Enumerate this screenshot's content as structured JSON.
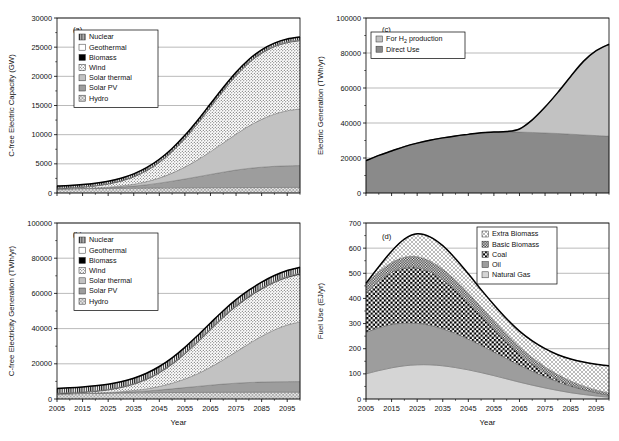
{
  "figure": {
    "title": "",
    "panels": [
      "a",
      "b",
      "c",
      "d"
    ],
    "xlabel": "Year",
    "x_ticks": [
      "2005",
      "2015",
      "2025",
      "2035",
      "2045",
      "2055",
      "2065",
      "2075",
      "2085",
      "2095"
    ],
    "x_range": [
      2005,
      2100
    ]
  },
  "chart_data": [
    {
      "id": "a",
      "tag": "(a)",
      "type": "area",
      "title": "",
      "xlabel": "Year",
      "ylabel": "C-free Electric Capacity (GW)",
      "ylim": [
        0,
        30000
      ],
      "y_ticks": [
        0,
        5000,
        10000,
        15000,
        20000,
        25000,
        30000
      ],
      "xlim": [
        2005,
        2100
      ],
      "x_ticks": [
        "2005",
        "2015",
        "2025",
        "2035",
        "2045",
        "2055",
        "2065",
        "2075",
        "2085",
        "2095"
      ],
      "grid": true,
      "legend_position": "upper-left",
      "stacked": true,
      "x": [
        2005,
        2010,
        2015,
        2020,
        2025,
        2030,
        2035,
        2040,
        2045,
        2050,
        2055,
        2060,
        2065,
        2070,
        2075,
        2080,
        2085,
        2090,
        2095,
        2100
      ],
      "series": [
        {
          "name": "Hydro",
          "pattern": "hydro-dots",
          "values": [
            700,
            720,
            740,
            760,
            780,
            800,
            820,
            840,
            860,
            880,
            895,
            905,
            915,
            925,
            935,
            940,
            945,
            950,
            955,
            960
          ]
        },
        {
          "name": "Solar PV",
          "pattern": "solid-mid-gray",
          "values": [
            5,
            15,
            35,
            70,
            130,
            220,
            360,
            560,
            830,
            1150,
            1500,
            1880,
            2270,
            2650,
            3000,
            3280,
            3480,
            3620,
            3700,
            3740
          ]
        },
        {
          "name": "Solar thermal",
          "pattern": "solid-light-gray",
          "values": [
            2,
            8,
            20,
            45,
            95,
            180,
            320,
            540,
            880,
            1380,
            2050,
            2900,
            3900,
            5000,
            6150,
            7250,
            8200,
            8950,
            9450,
            9700
          ]
        },
        {
          "name": "Wind",
          "pattern": "fine-dots",
          "values": [
            60,
            110,
            190,
            320,
            520,
            820,
            1250,
            1850,
            2650,
            3650,
            4850,
            6200,
            7600,
            8900,
            10000,
            10800,
            11300,
            11550,
            11650,
            11700
          ]
        },
        {
          "name": "Biomass",
          "pattern": "solid-black",
          "values": [
            40,
            45,
            50,
            55,
            60,
            65,
            70,
            75,
            80,
            85,
            88,
            90,
            92,
            94,
            96,
            97,
            98,
            99,
            100,
            100
          ]
        },
        {
          "name": "Geothermal",
          "pattern": "white",
          "values": [
            12,
            14,
            16,
            19,
            22,
            25,
            28,
            32,
            36,
            40,
            43,
            46,
            48,
            50,
            52,
            54,
            55,
            56,
            57,
            58
          ]
        },
        {
          "name": "Nuclear",
          "pattern": "vertical-stripes",
          "values": [
            370,
            380,
            390,
            400,
            410,
            420,
            430,
            440,
            450,
            455,
            460,
            465,
            468,
            470,
            472,
            474,
            476,
            478,
            480,
            480
          ]
        }
      ],
      "legend": [
        {
          "label": "Nuclear",
          "pattern": "vertical-stripes"
        },
        {
          "label": "Geothermal",
          "pattern": "white"
        },
        {
          "label": "Biomass",
          "pattern": "solid-black"
        },
        {
          "label": "Wind",
          "pattern": "fine-dots"
        },
        {
          "label": "Solar thermal",
          "pattern": "solid-light-gray"
        },
        {
          "label": "Solar PV",
          "pattern": "solid-mid-gray"
        },
        {
          "label": "Hydro",
          "pattern": "hydro-dots"
        }
      ]
    },
    {
      "id": "b",
      "tag": "(b)",
      "type": "area",
      "title": "",
      "xlabel": "Year",
      "ylabel": "C-free Electricity Generation (TWh/yr)",
      "ylim": [
        0,
        100000
      ],
      "y_ticks": [
        0,
        20000,
        40000,
        60000,
        80000,
        100000
      ],
      "xlim": [
        2005,
        2100
      ],
      "x_ticks": [
        "2005",
        "2015",
        "2025",
        "2035",
        "2045",
        "2055",
        "2065",
        "2075",
        "2085",
        "2095"
      ],
      "grid": true,
      "legend_position": "upper-left",
      "stacked": true,
      "x": [
        2005,
        2010,
        2015,
        2020,
        2025,
        2030,
        2035,
        2040,
        2045,
        2050,
        2055,
        2060,
        2065,
        2070,
        2075,
        2080,
        2085,
        2090,
        2095,
        2100
      ],
      "series": [
        {
          "name": "Hydro",
          "pattern": "hydro-dots",
          "values": [
            2900,
            3000,
            3100,
            3200,
            3300,
            3400,
            3480,
            3550,
            3620,
            3680,
            3720,
            3760,
            3790,
            3820,
            3840,
            3860,
            3875,
            3890,
            3900,
            3910
          ]
        },
        {
          "name": "Solar PV",
          "pattern": "solid-mid-gray",
          "values": [
            8,
            25,
            60,
            120,
            230,
            400,
            650,
            1000,
            1500,
            2100,
            2750,
            3400,
            4050,
            4650,
            5150,
            5500,
            5750,
            5880,
            5950,
            5980
          ]
        },
        {
          "name": "Solar thermal",
          "pattern": "solid-light-gray",
          "values": [
            4,
            15,
            40,
            95,
            200,
            390,
            700,
            1200,
            2000,
            3200,
            4900,
            7200,
            10200,
            13800,
            17800,
            22000,
            26000,
            29500,
            32200,
            33900
          ]
        },
        {
          "name": "Wind",
          "pattern": "fine-dots",
          "values": [
            140,
            260,
            470,
            820,
            1380,
            2250,
            3500,
            5300,
            7700,
            10700,
            14200,
            17900,
            21300,
            24000,
            25700,
            26500,
            26800,
            26900,
            26950,
            27000
          ]
        },
        {
          "name": "Biomass",
          "pattern": "solid-black",
          "values": [
            250,
            270,
            290,
            310,
            330,
            350,
            370,
            390,
            405,
            420,
            432,
            442,
            450,
            458,
            464,
            470,
            474,
            478,
            480,
            482
          ]
        },
        {
          "name": "Geothermal",
          "pattern": "white",
          "values": [
            60,
            70,
            82,
            96,
            112,
            130,
            148,
            168,
            188,
            208,
            224,
            238,
            250,
            260,
            268,
            275,
            280,
            284,
            288,
            290
          ]
        },
        {
          "name": "Nuclear",
          "pattern": "vertical-stripes",
          "values": [
            2650,
            2700,
            2760,
            2820,
            2880,
            2930,
            2980,
            3020,
            3060,
            3090,
            3120,
            3140,
            3160,
            3180,
            3195,
            3210,
            3220,
            3230,
            3240,
            3250
          ]
        }
      ],
      "legend": [
        {
          "label": "Nuclear",
          "pattern": "vertical-stripes"
        },
        {
          "label": "Geothermal",
          "pattern": "white"
        },
        {
          "label": "Biomass",
          "pattern": "solid-black"
        },
        {
          "label": "Wind",
          "pattern": "fine-dots"
        },
        {
          "label": "Solar thermal",
          "pattern": "solid-light-gray"
        },
        {
          "label": "Solar PV",
          "pattern": "solid-mid-gray"
        },
        {
          "label": "Hydro",
          "pattern": "hydro-dots"
        }
      ]
    },
    {
      "id": "c",
      "tag": "(c)",
      "type": "area",
      "title": "",
      "xlabel": "Year",
      "ylabel": "Electric Generation (TWh/yr)",
      "ylim": [
        0,
        100000
      ],
      "y_ticks": [
        0,
        20000,
        40000,
        60000,
        80000,
        100000
      ],
      "xlim": [
        2005,
        2100
      ],
      "x_ticks": [
        "2005",
        "2015",
        "2025",
        "2035",
        "2045",
        "2055",
        "2065",
        "2075",
        "2085",
        "2095"
      ],
      "grid": true,
      "legend_position": "upper-left",
      "stacked": true,
      "x": [
        2005,
        2010,
        2015,
        2020,
        2025,
        2030,
        2035,
        2040,
        2045,
        2050,
        2055,
        2060,
        2065,
        2070,
        2075,
        2080,
        2085,
        2090,
        2095,
        2100
      ],
      "series": [
        {
          "name": "Direct Use",
          "pattern": "solid-dark-gray",
          "values": [
            18500,
            21500,
            24000,
            26500,
            28500,
            30200,
            31500,
            32600,
            33500,
            34400,
            34800,
            34900,
            34800,
            34600,
            34300,
            34000,
            33600,
            33200,
            32800,
            32500
          ]
        },
        {
          "name": "For H2 production",
          "pattern": "solid-light-gray",
          "values": [
            0,
            0,
            0,
            0,
            0,
            0,
            0,
            0,
            0,
            0,
            0,
            200,
            1800,
            7200,
            14800,
            23500,
            33000,
            42000,
            48500,
            52500
          ]
        }
      ],
      "legend": [
        {
          "label": "For H",
          "label_sub": "2",
          "label_tail": " production",
          "pattern": "solid-light-gray"
        },
        {
          "label": "Direct Use",
          "pattern": "solid-dark-gray"
        }
      ]
    },
    {
      "id": "d",
      "tag": "(d)",
      "type": "area",
      "title": "",
      "xlabel": "Year",
      "ylabel": "Fuel Use (EJ/yr)",
      "ylim": [
        0,
        700
      ],
      "y_ticks": [
        0,
        100,
        200,
        300,
        400,
        500,
        600,
        700
      ],
      "xlim": [
        2005,
        2100
      ],
      "x_ticks": [
        "2005",
        "2015",
        "2025",
        "2035",
        "2045",
        "2055",
        "2065",
        "2075",
        "2085",
        "2095"
      ],
      "grid": true,
      "legend_position": "upper-right",
      "stacked": true,
      "x": [
        2005,
        2010,
        2015,
        2020,
        2025,
        2030,
        2035,
        2040,
        2045,
        2050,
        2055,
        2060,
        2065,
        2070,
        2075,
        2080,
        2085,
        2090,
        2095,
        2100
      ],
      "series": [
        {
          "name": "Natural Gas",
          "pattern": "solid-pale-gray",
          "values": [
            100,
            113,
            124,
            132,
            136,
            136,
            132,
            125,
            116,
            105,
            93,
            80,
            67,
            55,
            44,
            34,
            25,
            18,
            12,
            7
          ]
        },
        {
          "name": "Oil",
          "pattern": "solid-mid-gray",
          "values": [
            165,
            170,
            172,
            170,
            165,
            157,
            147,
            135,
            122,
            108,
            94,
            80,
            67,
            55,
            44,
            34,
            26,
            19,
            13,
            8
          ]
        },
        {
          "name": "Coal",
          "pattern": "check-grid",
          "values": [
            155,
            185,
            207,
            220,
            222,
            213,
            196,
            172,
            145,
            117,
            90,
            66,
            45,
            29,
            17,
            9,
            4,
            1,
            0,
            0
          ]
        },
        {
          "name": "Basic Biomass",
          "pattern": "dark-check",
          "values": [
            35,
            38,
            40,
            42,
            43,
            43,
            42,
            41,
            39,
            37,
            35,
            32,
            29,
            26,
            23,
            20,
            17,
            14,
            11,
            9
          ]
        },
        {
          "name": "Extra Biomass",
          "pattern": "coarse-dots",
          "values": [
            5,
            20,
            45,
            72,
            91,
            96,
            93,
            85,
            76,
            68,
            63,
            61,
            62,
            66,
            72,
            79,
            87,
            95,
            102,
            108
          ]
        }
      ],
      "legend": [
        {
          "label": "Extra Biomass",
          "pattern": "coarse-dots"
        },
        {
          "label": "Basic Biomass",
          "pattern": "dark-check"
        },
        {
          "label": "Coal",
          "pattern": "check-grid"
        },
        {
          "label": "Oil",
          "pattern": "solid-mid-gray"
        },
        {
          "label": "Natural Gas",
          "pattern": "solid-pale-gray"
        }
      ]
    }
  ],
  "colors": {
    "solid-black": "#000000",
    "solid-dark-gray": "#8a8a8a",
    "solid-mid-gray": "#9d9d9d",
    "solid-light-gray": "#c2c2c2",
    "solid-pale-gray": "#d5d5d5",
    "white": "#ffffff",
    "axis": "#000000",
    "grid": "#8c8c8c"
  }
}
